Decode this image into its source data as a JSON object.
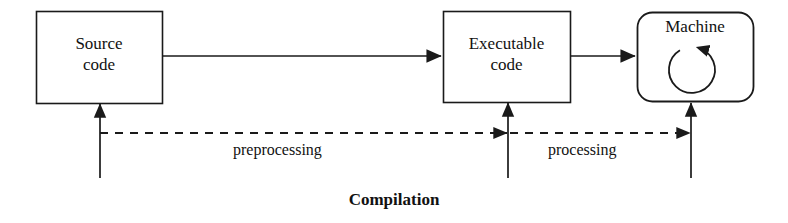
{
  "diagram": {
    "caption": "Compilation",
    "background_color": "#ffffff",
    "stroke_color": "#1a1a1a",
    "nodes": [
      {
        "id": "source-code",
        "label": "Source\ncode",
        "shape": "rectangle",
        "x": 36,
        "y": 11,
        "width": 126,
        "height": 92
      },
      {
        "id": "executable-code",
        "label": "Executable\ncode",
        "shape": "rectangle",
        "x": 443,
        "y": 11,
        "width": 127,
        "height": 91
      },
      {
        "id": "machine",
        "label": "Machine",
        "shape": "rounded-rectangle",
        "x": 637,
        "y": 12,
        "width": 116,
        "height": 90,
        "corner_radius": 14,
        "inner_icon": "circular-loop-arrow-icon"
      }
    ],
    "edges": [
      {
        "id": "source-to-executable",
        "from": "source-code",
        "to": "executable-code",
        "style": "solid",
        "direction": "right",
        "label": ""
      },
      {
        "id": "executable-to-machine",
        "from": "executable-code",
        "to": "machine",
        "style": "solid",
        "direction": "right",
        "label": ""
      },
      {
        "id": "preprocessing-flow",
        "from": "source-code-input",
        "to": "executable-code-input",
        "style": "dashed",
        "direction": "right",
        "label": "preprocessing"
      },
      {
        "id": "processing-flow",
        "from": "executable-code-input",
        "to": "machine-input",
        "style": "dashed",
        "direction": "right",
        "label": "processing"
      }
    ],
    "input_arrows": [
      {
        "id": "source-code-input",
        "x": 100,
        "top": 103,
        "bottom": 178
      },
      {
        "id": "executable-code-input",
        "x": 508,
        "top": 102,
        "bottom": 178
      },
      {
        "id": "machine-input",
        "x": 691,
        "top": 102,
        "bottom": 178
      }
    ],
    "labels": {
      "source_code": "Source\ncode",
      "executable_code": "Executable\ncode",
      "machine": "Machine",
      "preprocessing": "preprocessing",
      "processing": "processing",
      "compilation": "Compilation"
    }
  }
}
